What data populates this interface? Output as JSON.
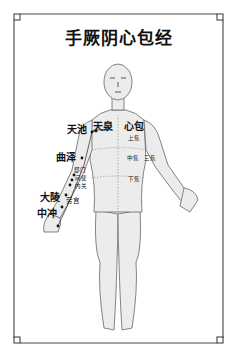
{
  "title": "手厥阴心包经",
  "colors": {
    "border": "#444444",
    "skin": "#ececec",
    "outline": "#666666",
    "text": "#111111"
  },
  "acupoints": [
    {
      "name": "天池",
      "label_id": "tianchi"
    },
    {
      "name": "天泉",
      "label_id": "tianquan"
    },
    {
      "name": "曲泽",
      "label_id": "quze"
    },
    {
      "name": "郄门",
      "label_id": "ximen"
    },
    {
      "name": "间使",
      "label_id": "jianshi"
    },
    {
      "name": "内关",
      "label_id": "neiguan"
    },
    {
      "name": "大陵",
      "label_id": "daling"
    },
    {
      "name": "劳宫",
      "label_id": "laogong"
    },
    {
      "name": "中冲",
      "label_id": "zhongchong"
    }
  ],
  "organs": {
    "pericardium": "心包",
    "upper_jiao": "上焦",
    "middle_jiao": "中焦",
    "lower_jiao": "下焦",
    "sanjiao": "三焦"
  }
}
